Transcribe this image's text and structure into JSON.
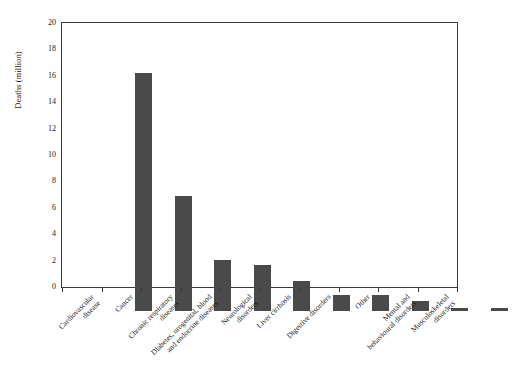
{
  "chart_data": {
    "type": "bar",
    "title": "",
    "xlabel": "",
    "ylabel": "Deaths (million)",
    "ylim": [
      0,
      20
    ],
    "ytick_values": [
      20,
      18,
      16,
      14,
      12,
      10,
      8,
      6,
      4,
      2,
      0
    ],
    "ytick_labels": [
      "20",
      "18",
      "16",
      "14",
      "12",
      "10",
      "8",
      "6",
      "4",
      "2",
      "0"
    ],
    "grid": false,
    "legend": null,
    "bar_color": "#4a4a4a",
    "categories": [
      "Cardiovascular disease",
      "Cancer",
      "Chronic respiratory diseases",
      "Diabetes, urogenital, blood and endocrine diseases",
      "Neurological disorders",
      "Liver cirrhosis",
      "Digestive disorders",
      "Other",
      "Mental and behavioural disorders",
      "Musculoskeletal disorders"
    ],
    "category_lines": [
      [
        "Cardiovascular",
        "disease"
      ],
      [
        "Cancer",
        ""
      ],
      [
        "Chronic respiratory",
        "diseases"
      ],
      [
        "Diabetes, urogenital, blood",
        "and endocrine diseases"
      ],
      [
        "Neurological",
        "disorders"
      ],
      [
        "Liver cirrhosis",
        ""
      ],
      [
        "Digestive disorders",
        ""
      ],
      [
        "Other",
        ""
      ],
      [
        "Mental and",
        "behavioural disorders"
      ],
      [
        "Musculoskeletal",
        "disorders"
      ]
    ],
    "values": [
      18.0,
      8.7,
      3.9,
      3.45,
      2.3,
      1.25,
      1.25,
      0.75,
      0.25,
      0.2
    ],
    "units": "million deaths"
  }
}
